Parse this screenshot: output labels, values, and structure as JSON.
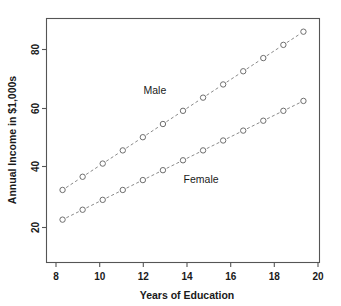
{
  "chart_data": {
    "type": "line",
    "title": "",
    "xlabel": "Years of Education",
    "ylabel": "Annual Income in $1,000s",
    "x": [
      8,
      9,
      10,
      11,
      12,
      13,
      14,
      15,
      16,
      17,
      18,
      19,
      20
    ],
    "xticks": [
      8,
      10,
      12,
      14,
      16,
      18,
      20
    ],
    "yticks": [
      20,
      40,
      60,
      80
    ],
    "xlim": [
      7.2,
      20.8
    ],
    "ylim": [
      14,
      88
    ],
    "grid": false,
    "legend": "inline-annotations",
    "series": [
      {
        "name": "Male",
        "values": [
          36,
          40,
          44,
          48,
          52,
          56,
          60,
          64,
          68,
          72,
          76,
          80,
          84
        ],
        "annotation": "Male",
        "annotation_x": 12.6,
        "annotation_y": 65,
        "marker": "open-circle",
        "linestyle": "dashed"
      },
      {
        "name": "Female",
        "values": [
          27,
          30,
          33,
          36,
          39,
          42,
          45,
          48,
          51,
          54,
          57,
          60,
          63
        ],
        "annotation": "Female",
        "annotation_x": 14.9,
        "annotation_y": 38,
        "marker": "open-circle",
        "linestyle": "dashed"
      }
    ]
  },
  "axes": {
    "x_title": "Years of Education",
    "y_title": "Annual Income in $1,000s",
    "x_tick_labels": [
      "8",
      "10",
      "12",
      "14",
      "16",
      "18",
      "20"
    ],
    "y_tick_labels": [
      "20",
      "40",
      "60",
      "80"
    ]
  },
  "annotations": {
    "male_label": "Male",
    "female_label": "Female"
  },
  "style": {
    "line_color": "#8a8a8a",
    "marker_color": "#6e6e6e",
    "frame_color": "#555555",
    "text_color": "#1a1a1a",
    "background": "#ffffff"
  }
}
